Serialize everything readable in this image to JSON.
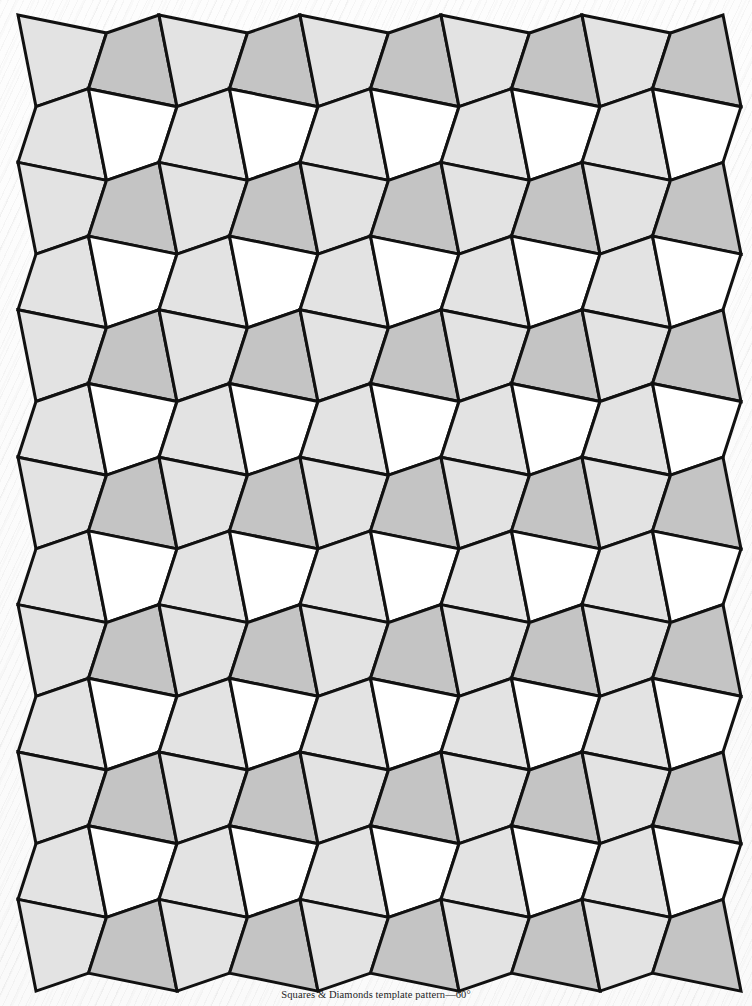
{
  "page": {
    "width": 752,
    "height": 1006,
    "background_color": "#fbfbfb",
    "texture": "diagonal-paper-grain"
  },
  "caption": {
    "text": "Squares & Diamonds template pattern—60°",
    "top": 989,
    "font_size": 10.5,
    "color": "#1d1d1d"
  },
  "pattern": {
    "name": "squares-and-diamonds-tessellation",
    "angle_label": "60°",
    "stroke_color": "#111111",
    "stroke_width": 3,
    "columns": 10,
    "rows": 13,
    "cell_width": 70.5,
    "row_height": 73.7,
    "zigzag_amplitude": 18,
    "lean": 18,
    "origin_x": 18,
    "origin_y": 15,
    "fills": {
      "light": "#e3e3e3",
      "medium": "#c4c4c4",
      "white": "#ffffff"
    },
    "row_styles": [
      {
        "type": "A",
        "even_cell": "light",
        "odd_cell": "medium"
      },
      {
        "type": "B",
        "even_cell": "light",
        "odd_cell": "white"
      }
    ]
  }
}
